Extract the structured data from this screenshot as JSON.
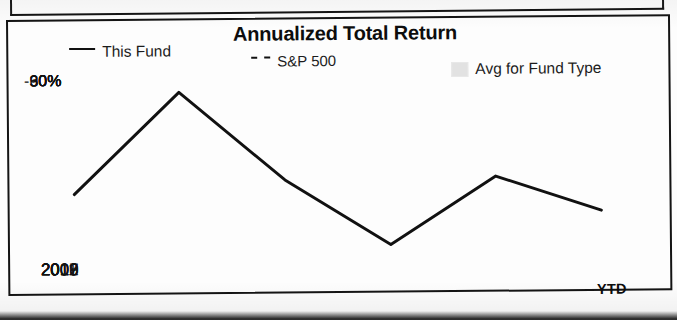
{
  "chart_data": {
    "type": "line",
    "title": "Annualized Total Return",
    "xlabel": "",
    "ylabel": "",
    "categories": [
      "2007",
      "2008",
      "2009",
      "2010",
      "2011",
      "2012"
    ],
    "x_axis_suffix": "YTD",
    "y_ticks": [
      "90%",
      "60%",
      "30%",
      "0%",
      "-30%"
    ],
    "y_tick_values": [
      90,
      60,
      30,
      0,
      -30
    ],
    "ylim": [
      -60,
      105
    ],
    "grid": false,
    "legend_position": "top",
    "series": [
      {
        "name": "This Fund",
        "style": "solid",
        "color": "#111111",
        "values": [
          0,
          93,
          12,
          -48,
          14,
          -18
        ]
      },
      {
        "name": "S&P 500",
        "style": "dashed",
        "color": "#111111",
        "values": [
          -37,
          22,
          13,
          -10,
          2,
          0
        ]
      },
      {
        "name": "Avg for Fund Type",
        "style": "band",
        "color": "#e2e2e2",
        "band_upper": [
          0,
          38,
          14,
          -5,
          5,
          -5
        ],
        "band_lower": [
          -40,
          -2,
          -5,
          -25,
          -8,
          -17
        ]
      }
    ]
  },
  "legend": {
    "items": [
      {
        "label": "This Fund",
        "icon": "solid-line-swatch"
      },
      {
        "label": "S&P 500",
        "icon": "dashed-line-swatch"
      },
      {
        "label": "Avg for Fund Type",
        "icon": "shaded-band-swatch"
      }
    ]
  }
}
